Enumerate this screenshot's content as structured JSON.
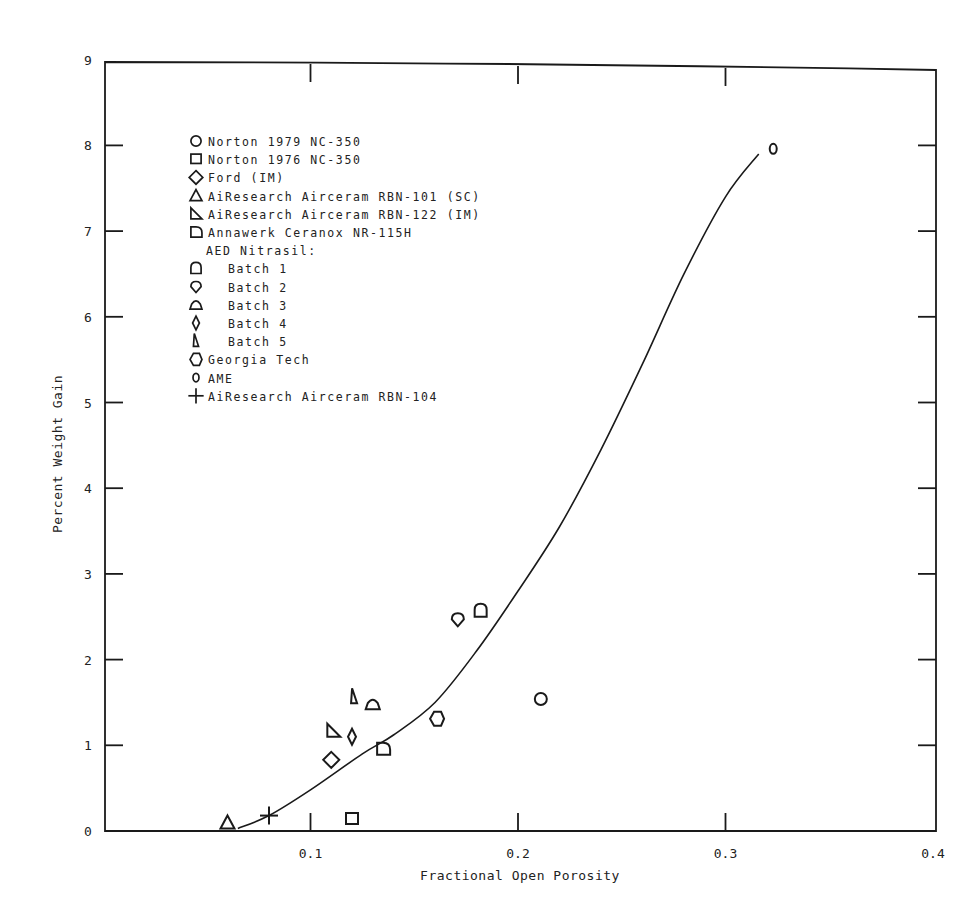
{
  "chart_data": {
    "type": "scatter",
    "title": "",
    "xlabel": "Fractional Open Porosity",
    "ylabel": "Percent Weight Gain",
    "xlim": [
      0,
      0.4
    ],
    "ylim": [
      0,
      9
    ],
    "grid": false,
    "legend_position": "upper-left (inside)",
    "x_ticks": [
      {
        "value": 0.1,
        "label": "0.1"
      },
      {
        "value": 0.2,
        "label": "0.2"
      },
      {
        "value": 0.3,
        "label": "0.3"
      },
      {
        "value": 0.4,
        "label": "0.4"
      }
    ],
    "y_ticks": [
      {
        "value": 0,
        "label": "0"
      },
      {
        "value": 1,
        "label": "1"
      },
      {
        "value": 2,
        "label": "2"
      },
      {
        "value": 3,
        "label": "3"
      },
      {
        "value": 4,
        "label": "4"
      },
      {
        "value": 5,
        "label": "5"
      },
      {
        "value": 6,
        "label": "6"
      },
      {
        "value": 7,
        "label": "7"
      },
      {
        "value": 8,
        "label": "8"
      },
      {
        "value": 9,
        "label": "9"
      }
    ],
    "legend": [
      {
        "label": "Norton 1979 NC-350",
        "marker": "circle",
        "indent": false
      },
      {
        "label": "Norton 1976 NC-350",
        "marker": "square",
        "indent": false
      },
      {
        "label": "Ford (IM)",
        "marker": "diamond",
        "indent": false
      },
      {
        "label": "AiResearch Airceram RBN-101 (SC)",
        "marker": "triangle",
        "indent": false
      },
      {
        "label": "AiResearch Airceram RBN-122 (IM)",
        "marker": "right-triangle",
        "indent": false
      },
      {
        "label": "Annawerk Ceranox NR-115H",
        "marker": "half-round-d",
        "indent": false
      },
      {
        "label": "AED Nitrasil:",
        "marker": "none",
        "indent": true
      },
      {
        "label": "Batch 1",
        "marker": "rounded-top-square",
        "indent": true
      },
      {
        "label": "Batch 2",
        "marker": "rounded-diamond",
        "indent": true
      },
      {
        "label": "Batch 3",
        "marker": "dome",
        "indent": true
      },
      {
        "label": "Batch 4",
        "marker": "tall-diamond",
        "indent": true
      },
      {
        "label": "Batch 5",
        "marker": "tall-triangle",
        "indent": true
      },
      {
        "label": "Georgia Tech",
        "marker": "hexagon",
        "indent": false
      },
      {
        "label": "AME",
        "marker": "small-oval",
        "indent": false
      },
      {
        "label": "AiResearch Airceram RBN-104",
        "marker": "cross",
        "indent": false
      }
    ],
    "series": [
      {
        "name": "Norton 1979 NC-350",
        "marker": "circle",
        "points": [
          {
            "x": 0.211,
            "y": 1.54
          }
        ]
      },
      {
        "name": "Norton 1976 NC-350",
        "marker": "square",
        "points": [
          {
            "x": 0.12,
            "y": 0.14
          }
        ]
      },
      {
        "name": "Ford (IM)",
        "marker": "diamond",
        "points": [
          {
            "x": 0.11,
            "y": 0.83
          }
        ]
      },
      {
        "name": "AiResearch Airceram RBN-101 (SC)",
        "marker": "triangle",
        "points": [
          {
            "x": 0.06,
            "y": 0.1
          }
        ]
      },
      {
        "name": "AiResearch Airceram RBN-122 (IM)",
        "marker": "right-triangle",
        "points": [
          {
            "x": 0.111,
            "y": 1.17
          }
        ]
      },
      {
        "name": "Annawerk Ceranox NR-115H",
        "marker": "half-round-d",
        "points": [
          {
            "x": 0.135,
            "y": 0.96
          }
        ]
      },
      {
        "name": "AED Nitrasil Batch 1",
        "marker": "rounded-top-square",
        "points": [
          {
            "x": 0.182,
            "y": 2.57
          }
        ]
      },
      {
        "name": "AED Nitrasil Batch 2",
        "marker": "rounded-diamond",
        "points": [
          {
            "x": 0.171,
            "y": 2.47
          }
        ]
      },
      {
        "name": "AED Nitrasil Batch 3",
        "marker": "dome",
        "points": [
          {
            "x": 0.13,
            "y": 1.48
          }
        ]
      },
      {
        "name": "AED Nitrasil Batch 4",
        "marker": "tall-diamond",
        "points": [
          {
            "x": 0.12,
            "y": 1.1
          }
        ]
      },
      {
        "name": "AED Nitrasil Batch 5",
        "marker": "tall-triangle",
        "points": [
          {
            "x": 0.121,
            "y": 1.56
          }
        ]
      },
      {
        "name": "Georgia Tech",
        "marker": "hexagon",
        "points": [
          {
            "x": 0.161,
            "y": 1.31
          }
        ]
      },
      {
        "name": "AME",
        "marker": "small-oval",
        "points": [
          {
            "x": 0.323,
            "y": 7.96
          }
        ]
      },
      {
        "name": "AiResearch Airceram RBN-104",
        "marker": "cross",
        "points": [
          {
            "x": 0.08,
            "y": 0.18
          }
        ]
      }
    ],
    "fit_curve": {
      "name": "trend curve",
      "points": [
        {
          "x": 0.065,
          "y": 0.03
        },
        {
          "x": 0.08,
          "y": 0.18
        },
        {
          "x": 0.1,
          "y": 0.48
        },
        {
          "x": 0.125,
          "y": 0.9
        },
        {
          "x": 0.14,
          "y": 1.12
        },
        {
          "x": 0.16,
          "y": 1.5
        },
        {
          "x": 0.18,
          "y": 2.1
        },
        {
          "x": 0.2,
          "y": 2.8
        },
        {
          "x": 0.22,
          "y": 3.55
        },
        {
          "x": 0.24,
          "y": 4.45
        },
        {
          "x": 0.26,
          "y": 5.45
        },
        {
          "x": 0.28,
          "y": 6.5
        },
        {
          "x": 0.3,
          "y": 7.4
        },
        {
          "x": 0.316,
          "y": 7.9
        }
      ]
    }
  }
}
